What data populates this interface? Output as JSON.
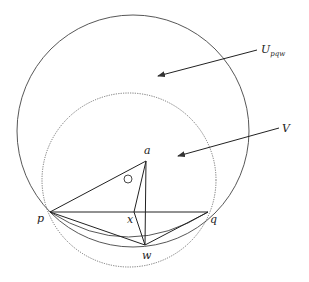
{
  "labels": {
    "a": "a",
    "p": "p",
    "q": "q",
    "x": "x",
    "w": "w",
    "U_main": "U",
    "U_sub": "pqw",
    "V": "V"
  },
  "colors": {
    "stroke": "#333333",
    "dotted": "#555555",
    "background": "#ffffff"
  },
  "points": {
    "p": [
      50,
      212
    ],
    "q": [
      208,
      212
    ],
    "a": [
      146,
      161
    ],
    "x": [
      134,
      212
    ],
    "w": [
      145,
      245
    ]
  },
  "circles": {
    "U_pqw": {
      "cx": 133,
      "cy": 131,
      "r": 116,
      "style": "solid"
    },
    "V": {
      "cx": 129,
      "cy": 180,
      "r": 87,
      "style": "dotted"
    },
    "small": {
      "cx": 128,
      "cy": 179,
      "r": 4
    }
  }
}
